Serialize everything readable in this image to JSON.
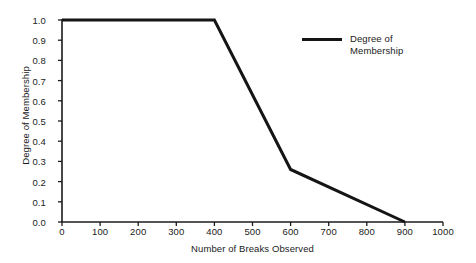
{
  "chart_data": {
    "type": "line",
    "title": "",
    "xlabel": "Number of Breaks Observed",
    "ylabel": "Degree of Membership",
    "xlim": [
      0,
      1000
    ],
    "ylim": [
      0.0,
      1.0
    ],
    "grid": false,
    "legend_position": "top-right",
    "xticks": [
      0,
      100,
      200,
      300,
      400,
      500,
      600,
      700,
      800,
      900,
      1000
    ],
    "xtick_labels": [
      "0",
      "100",
      "200",
      "300",
      "400",
      "500",
      "600",
      "700",
      "800",
      "900",
      "1000"
    ],
    "yticks": [
      0.0,
      0.1,
      0.2,
      0.3,
      0.4,
      0.5,
      0.6,
      0.7,
      0.8,
      0.9,
      1.0
    ],
    "ytick_labels": [
      "0.0",
      "0.1",
      "0.2",
      "0.3",
      "0.4",
      "0.5",
      "0.6",
      "0.7",
      "0.8",
      "0.9",
      "1.0"
    ],
    "series": [
      {
        "name": "Degree of Membership",
        "color": "#151515",
        "line_width": 3,
        "x": [
          0,
          400,
          600,
          900
        ],
        "y": [
          1.0,
          1.0,
          0.26,
          0.0
        ]
      }
    ]
  },
  "legend": {
    "entries": [
      {
        "label": "Degree of Membership",
        "color": "#151515"
      }
    ]
  },
  "axes": {
    "x_title": "Number of Breaks Observed",
    "y_title": "Degree of Membership"
  },
  "colors": {
    "line": "#151515",
    "axis": "#1b1b1b",
    "background": "#ffffff"
  }
}
